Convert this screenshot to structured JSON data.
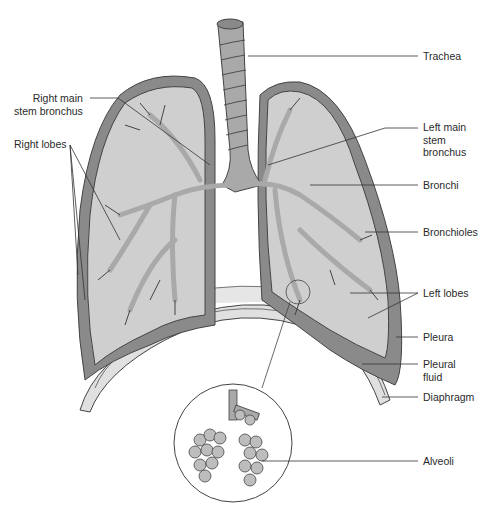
{
  "colors": {
    "pleura_dark": "#8a8a8a",
    "lung_mid": "#a9a9a9",
    "lung_light": "#cfcfcf",
    "diaphragm": "#e0e0e0",
    "outline": "#444444",
    "alveoli": "#bdbdbd",
    "leader": "#333333"
  },
  "labels": {
    "trachea": "Trachea",
    "right_main_stem_bronchus": "Right main\nstem bronchus",
    "right_lobes": "Right lobes",
    "left_main_stem_bronchus": "Left main\nstem\nbronchus",
    "bronchi": "Bronchi",
    "bronchioles": "Bronchioles",
    "left_lobes": "Left lobes",
    "pleura": "Pleura",
    "pleural_fluid": "Pleural\nfluid",
    "diaphragm": "Diaphragm",
    "alveoli": "Alveoli"
  }
}
